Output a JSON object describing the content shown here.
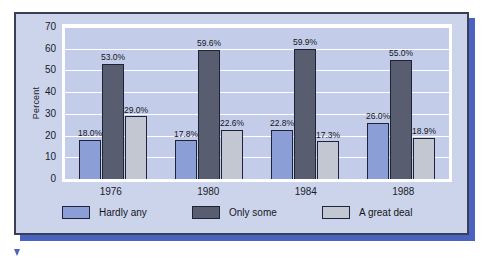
{
  "chart_data": {
    "type": "bar",
    "title": "",
    "subtitle": "",
    "xlabel": "",
    "ylabel": "Percent",
    "categories": [
      "1976",
      "1980",
      "1984",
      "1988"
    ],
    "ylim": [
      0,
      70
    ],
    "yticks": [
      0,
      10,
      20,
      30,
      40,
      50,
      60,
      70
    ],
    "ytick_labels": [
      "0",
      "10",
      "20",
      "30",
      "40",
      "50",
      "60",
      "70"
    ],
    "grid": true,
    "legend_position": "bottom",
    "series": [
      {
        "name": "Hardly any",
        "color": "#8c9ed6",
        "values": [
          18.0,
          17.8,
          22.8,
          26.0
        ],
        "labels": [
          "18.0%",
          "17.8%",
          "22.8%",
          "26.0%"
        ]
      },
      {
        "name": "Only some",
        "color": "#585d70",
        "values": [
          53.0,
          59.6,
          59.9,
          55.0
        ],
        "labels": [
          "53.0%",
          "59.6%",
          "59.9%",
          "55.0%"
        ]
      },
      {
        "name": "A great deal",
        "color": "#c2c7d2",
        "values": [
          29.0,
          22.6,
          17.3,
          18.9
        ],
        "labels": [
          "29.0%",
          "22.6%",
          "17.3%",
          "18.9%"
        ]
      }
    ]
  },
  "colors": {
    "panel_background": "#ccd4ec",
    "panel_border": "#3a3f55",
    "panel_shadow": "#4a63c0",
    "plot_background": "#c3cde9",
    "gridline": "#ffffff",
    "text": "#141420"
  }
}
